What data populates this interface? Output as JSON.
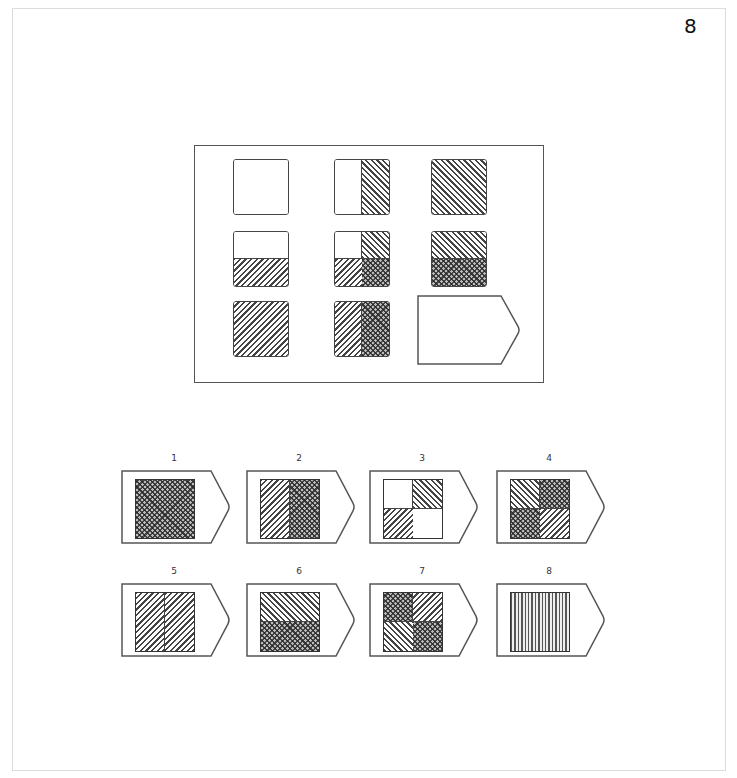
{
  "page_number": "8",
  "matrix": {
    "cells": [
      {
        "row": 1,
        "col": 1,
        "layout": "g1",
        "fills": [
          "blank"
        ]
      },
      {
        "row": 1,
        "col": 2,
        "layout": "gv",
        "fills": [
          "blank",
          "d1"
        ]
      },
      {
        "row": 1,
        "col": 3,
        "layout": "g1",
        "fills": [
          "d1"
        ]
      },
      {
        "row": 2,
        "col": 1,
        "layout": "gh",
        "fills": [
          "blank",
          "d2"
        ]
      },
      {
        "row": 2,
        "col": 2,
        "layout": "g4",
        "fills": [
          "blank",
          "d1",
          "d2",
          "cross"
        ]
      },
      {
        "row": 2,
        "col": 3,
        "layout": "gh",
        "fills": [
          "d1",
          "cross"
        ]
      },
      {
        "row": 3,
        "col": 1,
        "layout": "g1",
        "fills": [
          "d2"
        ]
      },
      {
        "row": 3,
        "col": 2,
        "layout": "gv",
        "fills": [
          "d2",
          "cross"
        ]
      },
      {
        "row": 3,
        "col": 3,
        "layout": "missing",
        "fills": []
      }
    ]
  },
  "options": [
    {
      "label": "1",
      "layout": "g1",
      "fills": [
        "cross"
      ]
    },
    {
      "label": "2",
      "layout": "gv",
      "fills": [
        "d2",
        "cross"
      ]
    },
    {
      "label": "3",
      "layout": "g4",
      "fills": [
        "blank",
        "d1",
        "d2",
        "blank"
      ]
    },
    {
      "label": "4",
      "layout": "g4",
      "fills": [
        "d1",
        "cross",
        "cross",
        "d2"
      ]
    },
    {
      "label": "5",
      "layout": "gv",
      "fills": [
        "d2",
        "d2"
      ]
    },
    {
      "label": "6",
      "layout": "gh",
      "fills": [
        "d1",
        "cross"
      ]
    },
    {
      "label": "7",
      "layout": "g4",
      "fills": [
        "cross",
        "d2",
        "d1",
        "cross"
      ]
    },
    {
      "label": "8",
      "layout": "g1",
      "fills": [
        "vert"
      ]
    }
  ]
}
